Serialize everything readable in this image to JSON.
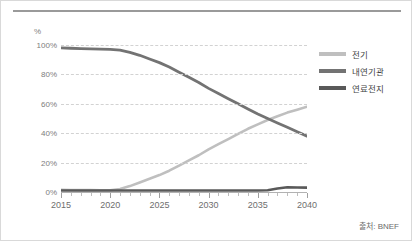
{
  "source_note": "출처: BNEF",
  "unit_label": "%",
  "legend": {
    "items": [
      {
        "label": "전기",
        "color": "#bfbfbf"
      },
      {
        "label": "내연기관",
        "color": "#737373"
      },
      {
        "label": "연료전지",
        "color": "#595959"
      }
    ]
  },
  "axis": {
    "y_ticks": [
      "0%",
      "20%",
      "40%",
      "60%",
      "80%",
      "100%"
    ],
    "x_ticks": [
      "2015",
      "2020",
      "2025",
      "2030",
      "2035",
      "2040"
    ]
  },
  "chart_data": {
    "type": "line",
    "title": "",
    "subtitle": "",
    "xlabel": "",
    "ylabel": "%",
    "xlim": [
      2015,
      2040
    ],
    "ylim": [
      0,
      100
    ],
    "grid": true,
    "legend_position": "right",
    "x": [
      2015,
      2016,
      2017,
      2018,
      2019,
      2020,
      2021,
      2022,
      2023,
      2024,
      2025,
      2026,
      2027,
      2028,
      2029,
      2030,
      2031,
      2032,
      2033,
      2034,
      2035,
      2036,
      2037,
      2038,
      2039,
      2040
    ],
    "series": [
      {
        "name": "전기",
        "color": "#bfbfbf",
        "values": [
          1.5,
          1.4,
          1.3,
          1.3,
          1.2,
          1.2,
          2.0,
          4.0,
          6.5,
          9.0,
          11.5,
          14.5,
          18.0,
          21.5,
          25.0,
          29.0,
          32.5,
          36.0,
          39.5,
          43.0,
          46.0,
          49.0,
          51.5,
          54.0,
          56.0,
          58.0
        ]
      },
      {
        "name": "내연기관",
        "color": "#737373",
        "values": [
          98.0,
          97.8,
          97.6,
          97.4,
          97.2,
          97.0,
          96.5,
          95.0,
          93.0,
          90.5,
          88.0,
          85.0,
          81.5,
          78.0,
          74.5,
          70.5,
          67.0,
          63.5,
          60.0,
          56.5,
          53.0,
          50.0,
          47.0,
          44.0,
          41.0,
          38.0
        ]
      },
      {
        "name": "연료전지",
        "color": "#595959",
        "values": [
          1.0,
          1.0,
          1.0,
          1.0,
          1.0,
          1.0,
          1.0,
          1.0,
          1.0,
          1.0,
          1.0,
          1.0,
          1.0,
          1.0,
          1.0,
          1.0,
          1.0,
          1.0,
          1.0,
          1.0,
          1.0,
          1.2,
          2.4,
          3.2,
          3.1,
          3.0
        ]
      }
    ],
    "annotations": []
  }
}
